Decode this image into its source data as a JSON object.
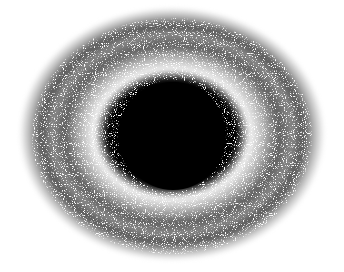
{
  "image": {
    "description": "Black circular disk surrounded by a swirling noisy gray halo on white background",
    "colors": {
      "background": "#ffffff",
      "disk": "#000000",
      "halo_dark": "#444444",
      "halo_light": "#d0d0d0"
    }
  }
}
